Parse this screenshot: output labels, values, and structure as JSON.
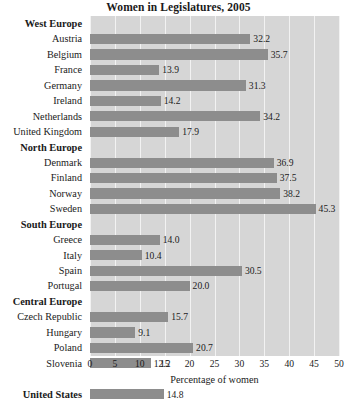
{
  "chart_data": {
    "type": "bar",
    "orientation": "horizontal",
    "title": "Women in Legislatures, 2005",
    "xlabel": "Percentage of women",
    "ylabel": "",
    "xlim": [
      0,
      50
    ],
    "xticks": [
      0,
      5,
      10,
      15,
      20,
      25,
      30,
      35,
      40,
      45,
      50
    ],
    "xtick_labels": [
      "0",
      "5",
      "10",
      "15",
      "20",
      "25",
      "30",
      "35",
      "40",
      "45",
      "50"
    ],
    "grid": true,
    "grid_axis": "x",
    "legend": "none",
    "bar_color": "#8d8d8d",
    "plot_background": "#d6d6d6",
    "gridline_color": "#f2f2f2",
    "value_label_format": "one decimal, at end of bar",
    "categories": [
      "Austria",
      "Belgium",
      "France",
      "Germany",
      "Ireland",
      "Netherlands",
      "United Kingdom",
      "Denmark",
      "Finland",
      "Norway",
      "Sweden",
      "Greece",
      "Italy",
      "Spain",
      "Portugal",
      "Czech Republic",
      "Hungary",
      "Poland",
      "Slovenia",
      "United States"
    ],
    "values": [
      32.2,
      35.7,
      13.9,
      31.3,
      14.2,
      34.2,
      17.9,
      36.9,
      37.5,
      38.2,
      45.3,
      14.0,
      10.4,
      30.5,
      20.0,
      15.7,
      9.1,
      20.7,
      12.2,
      14.8
    ],
    "groups": [
      {
        "name": "West Europe",
        "members": [
          "Austria",
          "Belgium",
          "France",
          "Germany",
          "Ireland",
          "Netherlands",
          "United Kingdom"
        ]
      },
      {
        "name": "North Europe",
        "members": [
          "Denmark",
          "Finland",
          "Norway",
          "Sweden"
        ]
      },
      {
        "name": "South Europe",
        "members": [
          "Greece",
          "Italy",
          "Spain",
          "Portugal"
        ]
      },
      {
        "name": "Central Europe",
        "members": [
          "Czech Republic",
          "Hungary",
          "Poland",
          "Slovenia"
        ]
      },
      {
        "name": "United States",
        "members": []
      }
    ]
  },
  "rows": [
    {
      "kind": "group",
      "label": "West Europe",
      "value": null
    },
    {
      "kind": "bar",
      "label": "Austria",
      "value": 32.2,
      "value_text": "32.2"
    },
    {
      "kind": "bar",
      "label": "Belgium",
      "value": 35.7,
      "value_text": "35.7"
    },
    {
      "kind": "bar",
      "label": "France",
      "value": 13.9,
      "value_text": "13.9"
    },
    {
      "kind": "bar",
      "label": "Germany",
      "value": 31.3,
      "value_text": "31.3"
    },
    {
      "kind": "bar",
      "label": "Ireland",
      "value": 14.2,
      "value_text": "14.2"
    },
    {
      "kind": "bar",
      "label": "Netherlands",
      "value": 34.2,
      "value_text": "34.2"
    },
    {
      "kind": "bar",
      "label": "United Kingdom",
      "value": 17.9,
      "value_text": "17.9"
    },
    {
      "kind": "group",
      "label": "North Europe",
      "value": null
    },
    {
      "kind": "bar",
      "label": "Denmark",
      "value": 36.9,
      "value_text": "36.9"
    },
    {
      "kind": "bar",
      "label": "Finland",
      "value": 37.5,
      "value_text": "37.5"
    },
    {
      "kind": "bar",
      "label": "Norway",
      "value": 38.2,
      "value_text": "38.2"
    },
    {
      "kind": "bar",
      "label": "Sweden",
      "value": 45.3,
      "value_text": "45.3"
    },
    {
      "kind": "group",
      "label": "South Europe",
      "value": null
    },
    {
      "kind": "bar",
      "label": "Greece",
      "value": 14.0,
      "value_text": "14.0"
    },
    {
      "kind": "bar",
      "label": "Italy",
      "value": 10.4,
      "value_text": "10.4"
    },
    {
      "kind": "bar",
      "label": "Spain",
      "value": 30.5,
      "value_text": "30.5"
    },
    {
      "kind": "bar",
      "label": "Portugal",
      "value": 20.0,
      "value_text": "20.0"
    },
    {
      "kind": "group",
      "label": "Central Europe",
      "value": null
    },
    {
      "kind": "bar",
      "label": "Czech Republic",
      "value": 15.7,
      "value_text": "15.7"
    },
    {
      "kind": "bar",
      "label": "Hungary",
      "value": 9.1,
      "value_text": "9.1"
    },
    {
      "kind": "bar",
      "label": "Poland",
      "value": 20.7,
      "value_text": "20.7"
    },
    {
      "kind": "bar",
      "label": "Slovenia",
      "value": 12.2,
      "value_text": "12.2"
    },
    {
      "kind": "spacer",
      "label": "",
      "value": null
    },
    {
      "kind": "bar",
      "label": "United States",
      "value": 14.8,
      "value_text": "14.8",
      "bold": true
    }
  ]
}
